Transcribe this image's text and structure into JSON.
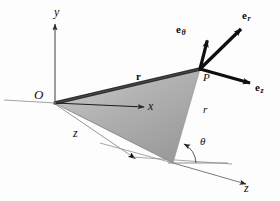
{
  "figure": {
    "background_color": "#fdfdfd",
    "ink_color": "#0d0d0d",
    "plane_fill_color": "#a8a8a8",
    "plane_edge_color": "#3a3a3a"
  },
  "axes": [
    {
      "name": "y-axis",
      "label": "y",
      "direction": "up",
      "has_arrow": true
    },
    {
      "name": "x-axis",
      "label": "x",
      "direction": "right",
      "has_arrow": true
    },
    {
      "name": "z-axis-upper",
      "label": "z",
      "direction": "down-right",
      "has_arrow": true
    },
    {
      "name": "z-axis-lower",
      "label": "z",
      "direction": "down-right",
      "has_arrow": true
    }
  ],
  "points": [
    {
      "name": "origin",
      "label": "O"
    },
    {
      "name": "point-p",
      "label": "P"
    }
  ],
  "vectors": [
    {
      "name": "e-theta",
      "base": "e",
      "subscript": "θ",
      "description": "unit vector in theta direction",
      "direction": "up-left"
    },
    {
      "name": "e-r",
      "base": "e",
      "subscript": "r",
      "description": "unit vector in radial direction",
      "direction": "up-right"
    },
    {
      "name": "e-z",
      "base": "e",
      "subscript": "z",
      "description": "unit vector in axial direction",
      "direction": "down-right"
    },
    {
      "name": "position-vector-r",
      "base": "r",
      "subscript": "",
      "description": "position vector from O to P",
      "direction": "right"
    }
  ],
  "scalars": [
    {
      "name": "radius-r",
      "label": "r"
    },
    {
      "name": "angle-theta",
      "label": "θ"
    }
  ]
}
